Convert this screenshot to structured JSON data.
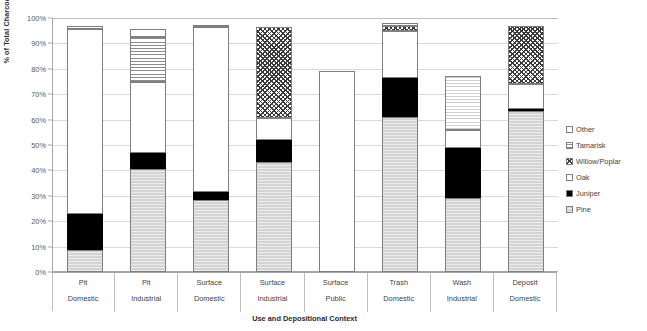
{
  "chart_data": {
    "type": "bar",
    "subtype": "stacked-bar-100",
    "title": "",
    "xlabel": "Use and Depositional Context",
    "ylabel": "% of Total Charcoal Weight",
    "ylim": [
      0,
      100
    ],
    "ytick_labels": [
      "0%",
      "10%",
      "20%",
      "30%",
      "40%",
      "50%",
      "60%",
      "70%",
      "80%",
      "90%",
      "100%"
    ],
    "ytick_values": [
      0,
      10,
      20,
      30,
      40,
      50,
      60,
      70,
      80,
      90,
      100
    ],
    "grid": true,
    "legend_position": "right",
    "categories": [
      {
        "line1": "Pit",
        "line2": "Domestic"
      },
      {
        "line1": "Pit",
        "line2": "Industrial"
      },
      {
        "line1": "Surface",
        "line2": "Domestic"
      },
      {
        "line1": "Surface",
        "line2": "Industrial"
      },
      {
        "line1": "Surface",
        "line2": "Public"
      },
      {
        "line1": "Trash",
        "line2": "Domestic"
      },
      {
        "line1": "Wash",
        "line2": "Industrial"
      },
      {
        "line1": "Deposit",
        "line2": "Domestic"
      }
    ],
    "series": [
      {
        "name": "Pine",
        "pattern": "light-gray-fill",
        "values": [
          8.8,
          40.5,
          28.5,
          43.5,
          0.0,
          61.0,
          29.0,
          63.5
        ]
      },
      {
        "name": "Juniper",
        "pattern": "solid-black",
        "values": [
          14.0,
          6.5,
          3.0,
          8.5,
          0.0,
          15.5,
          20.0,
          0.8
        ]
      },
      {
        "name": "Oak",
        "pattern": "white-fill",
        "values": [
          72.7,
          28.0,
          65.0,
          8.5,
          79.0,
          18.5,
          7.0,
          9.7
        ]
      },
      {
        "name": "Willow/Poplar",
        "pattern": "crosshatch",
        "values": [
          0.0,
          0.0,
          0.0,
          36.0,
          0.0,
          2.0,
          0.0,
          23.0
        ]
      },
      {
        "name": "Tamarisk",
        "pattern": "horizontal-lines",
        "values": [
          0.0,
          17.5,
          0.0,
          0.0,
          0.0,
          0.0,
          21.0,
          0.0
        ]
      },
      {
        "name": "Other",
        "pattern": "white-fill-thin-border",
        "values": [
          1.5,
          3.0,
          0.9,
          0.0,
          0.0,
          1.0,
          0.0,
          0.0
        ]
      }
    ],
    "bar_totals": [
      97.0,
      95.5,
      97.4,
      96.5,
      79.0,
      98.0,
      77.0,
      97.0
    ]
  },
  "legend": {
    "items": [
      {
        "label": "Other",
        "pattern": "white"
      },
      {
        "label": "Tamarisk",
        "pattern": "horizontal-lines"
      },
      {
        "label": "Willow/Poplar",
        "pattern": "crosshatch"
      },
      {
        "label": "Oak",
        "pattern": "white"
      },
      {
        "label": "Juniper",
        "pattern": "solid-black"
      },
      {
        "label": "Pine",
        "pattern": "light-gray"
      }
    ]
  }
}
